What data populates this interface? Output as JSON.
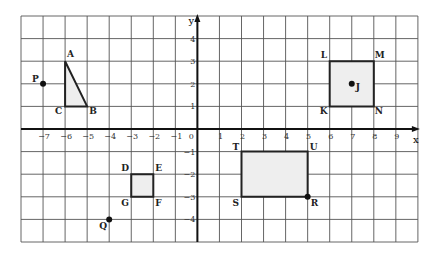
{
  "grid": {
    "x_min": -8,
    "x_max": 10,
    "y_min": -5,
    "y_max": 5,
    "left_px": 21,
    "top_px": 16,
    "cell_w": 22.05,
    "cell_h": 22.6,
    "line_color": "#555555",
    "fill_color": "#eeeeee"
  },
  "axes": {
    "x_label": "x",
    "y_label": "y",
    "origin_label": "0",
    "x_ticks": [
      {
        "v": -7,
        "label": "−7"
      },
      {
        "v": -6,
        "label": "−6"
      },
      {
        "v": -5,
        "label": "−5"
      },
      {
        "v": -4,
        "label": "−4"
      },
      {
        "v": -3,
        "label": "−3"
      },
      {
        "v": -2,
        "label": "−2"
      },
      {
        "v": -1,
        "label": "−1"
      },
      {
        "v": 1,
        "label": "1"
      },
      {
        "v": 2,
        "label": "2"
      },
      {
        "v": 3,
        "label": "3"
      },
      {
        "v": 4,
        "label": "4"
      },
      {
        "v": 5,
        "label": "5"
      },
      {
        "v": 6,
        "label": "6"
      },
      {
        "v": 7,
        "label": "7"
      },
      {
        "v": 8,
        "label": "8"
      },
      {
        "v": 9,
        "label": "9"
      }
    ],
    "y_ticks": [
      {
        "v": 4,
        "label": "4"
      },
      {
        "v": 3,
        "label": "3"
      },
      {
        "v": 2,
        "label": "2"
      },
      {
        "v": 1,
        "label": "1"
      },
      {
        "v": -1,
        "label": "−1"
      },
      {
        "v": -2,
        "label": "−2"
      },
      {
        "v": -3,
        "label": "−3"
      },
      {
        "v": -4,
        "label": "−4"
      }
    ]
  },
  "shapes": [
    {
      "name": "triangle-ABC",
      "points": [
        [
          -6,
          3
        ],
        [
          -5,
          1
        ],
        [
          -6,
          1
        ]
      ]
    },
    {
      "name": "square-DEFG",
      "points": [
        [
          -3,
          -2
        ],
        [
          -2,
          -2
        ],
        [
          -2,
          -3
        ],
        [
          -3,
          -3
        ]
      ]
    },
    {
      "name": "square-KLMN",
      "points": [
        [
          6,
          1
        ],
        [
          6,
          3
        ],
        [
          8,
          3
        ],
        [
          8,
          1
        ]
      ]
    },
    {
      "name": "rectangle-STUR",
      "points": [
        [
          2,
          -3
        ],
        [
          2,
          -1
        ],
        [
          5,
          -1
        ],
        [
          5,
          -3
        ]
      ]
    }
  ],
  "points": [
    {
      "label": "P",
      "x": -7,
      "y": 2,
      "dot": true,
      "dx": -11,
      "dy": -2
    },
    {
      "label": "Q",
      "x": -4,
      "y": -4,
      "dot": true,
      "dx": -10,
      "dy": 10
    },
    {
      "label": "J",
      "x": 7,
      "y": 2,
      "dot": true,
      "dx": 4,
      "dy": 6
    },
    {
      "label": "R",
      "x": 5,
      "y": -3,
      "dot": true,
      "dx": 3,
      "dy": 9
    },
    {
      "label": "A",
      "x": -6,
      "y": 3,
      "dot": false,
      "dx": 2,
      "dy": -4
    },
    {
      "label": "B",
      "x": -5,
      "y": 1,
      "dot": false,
      "dx": 2,
      "dy": 8
    },
    {
      "label": "C",
      "x": -6,
      "y": 1,
      "dot": false,
      "dx": -10,
      "dy": 8
    },
    {
      "label": "D",
      "x": -3,
      "y": -2,
      "dot": false,
      "dx": -10,
      "dy": -3
    },
    {
      "label": "E",
      "x": -2,
      "y": -2,
      "dot": false,
      "dx": 2,
      "dy": -3
    },
    {
      "label": "F",
      "x": -2,
      "y": -3,
      "dot": false,
      "dx": 2,
      "dy": 9
    },
    {
      "label": "G",
      "x": -3,
      "y": -3,
      "dot": false,
      "dx": -10,
      "dy": 9
    },
    {
      "label": "K",
      "x": 6,
      "y": 1,
      "dot": false,
      "dx": -10,
      "dy": 8
    },
    {
      "label": "L",
      "x": 6,
      "y": 3,
      "dot": false,
      "dx": -9,
      "dy": -3
    },
    {
      "label": "M",
      "x": 8,
      "y": 3,
      "dot": false,
      "dx": 1,
      "dy": -3
    },
    {
      "label": "N",
      "x": 8,
      "y": 1,
      "dot": false,
      "dx": 1,
      "dy": 8
    },
    {
      "label": "T",
      "x": 2,
      "y": -1,
      "dot": false,
      "dx": -9,
      "dy": -2
    },
    {
      "label": "U",
      "x": 5,
      "y": -1,
      "dot": false,
      "dx": 2,
      "dy": -2
    },
    {
      "label": "S",
      "x": 2,
      "y": -3,
      "dot": false,
      "dx": -9,
      "dy": 9
    }
  ]
}
